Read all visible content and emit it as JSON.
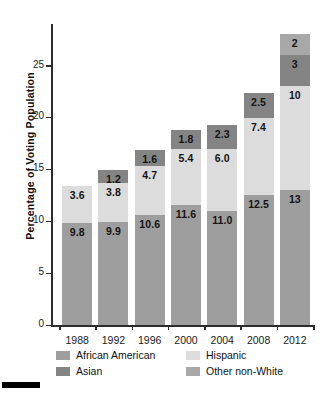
{
  "chart_data": {
    "type": "bar",
    "subtype": "stacked-bar",
    "title": "",
    "subtitle": "",
    "xlabel": "",
    "ylabel": "Percentage of Voting Population",
    "categories": [
      "1988",
      "1992",
      "1996",
      "2000",
      "2004",
      "2008",
      "2012"
    ],
    "series": [
      {
        "name": "African American",
        "color": "#9e9e9e",
        "values": [
          9.8,
          9.9,
          10.6,
          11.6,
          11.0,
          12.5,
          13
        ],
        "labels": [
          "9.8",
          "9.9",
          "10.6",
          "11.6",
          "11.0",
          "12.5",
          "13"
        ]
      },
      {
        "name": "Hispanic",
        "color": "#dcdcdc",
        "values": [
          3.6,
          3.8,
          4.7,
          5.4,
          6.0,
          7.4,
          10
        ],
        "labels": [
          "3.6",
          "3.8",
          "4.7",
          "5.4",
          "6.0",
          "7.4",
          "10"
        ]
      },
      {
        "name": "Asian",
        "color": "#848484",
        "values": [
          0,
          1.2,
          1.6,
          1.8,
          2.3,
          2.5,
          3
        ],
        "labels": [
          "",
          "1.2",
          "1.6",
          "1.8",
          "2.3",
          "2.5",
          "3"
        ]
      },
      {
        "name": "Other non-White",
        "color": "#a8a8a8",
        "values": [
          0,
          0,
          0,
          0,
          0,
          0,
          2
        ],
        "labels": [
          "",
          "",
          "",
          "",
          "",
          "",
          "2"
        ]
      }
    ],
    "totals": [
      13.4,
      14.9,
      16.9,
      18.8,
      19.3,
      22.4,
      28.0
    ],
    "yticks": [
      0,
      5,
      10,
      15,
      20,
      25
    ],
    "ylim": [
      0,
      29
    ],
    "grid": false,
    "legend_position": "bottom",
    "legend": [
      {
        "label": "African American",
        "color": "#9e9e9e"
      },
      {
        "label": "Hispanic",
        "color": "#dcdcdc"
      },
      {
        "label": "Asian",
        "color": "#848484"
      },
      {
        "label": "Other non-White",
        "color": "#a8a8a8"
      }
    ]
  },
  "axis": {
    "y_label": "Percentage of Voting Population",
    "y_ticks": [
      "0",
      "5",
      "10",
      "15",
      "20",
      "25"
    ],
    "x_ticks": [
      "1988",
      "1992",
      "1996",
      "2000",
      "2004",
      "2008",
      "2012"
    ]
  },
  "legend": {
    "african_american": "African American",
    "hispanic": "Hispanic",
    "asian": "Asian",
    "other_non_white": "Other non-White"
  },
  "values": {
    "aa": [
      "9.8",
      "9.9",
      "10.6",
      "11.6",
      "11.0",
      "12.5",
      "13"
    ],
    "hi": [
      "3.6",
      "3.8",
      "4.7",
      "5.4",
      "6.0",
      "7.4",
      "10"
    ],
    "as": [
      "",
      "1.2",
      "1.6",
      "1.8",
      "2.3",
      "2.5",
      "3"
    ],
    "ot": [
      "",
      "",
      "",
      "",
      "",
      "",
      "2"
    ]
  },
  "colors": {
    "african_american": "#9e9e9e",
    "hispanic": "#dcdcdc",
    "asian": "#848484",
    "other_non_white": "#a8a8a8",
    "axis": "#2c2c2c",
    "text": "#1a1a1a",
    "background": "#ffffff"
  }
}
